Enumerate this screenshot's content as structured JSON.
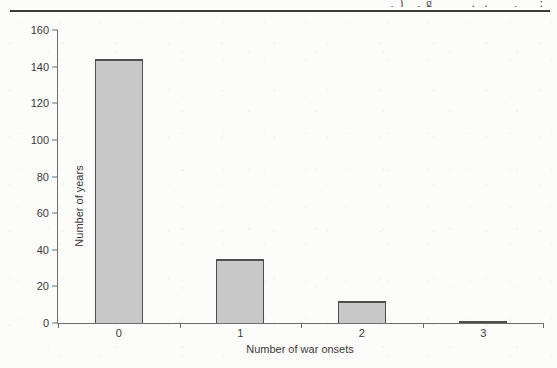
{
  "page": {
    "cropped_header_fragment": ", )   , g         .  .      ,     ;"
  },
  "chart_data": {
    "type": "bar",
    "title": "",
    "xlabel": "Number of war onsets",
    "ylabel": "Number of years",
    "categories": [
      "0",
      "1",
      "2",
      "3"
    ],
    "values": [
      144,
      35,
      12,
      1
    ],
    "ylim": [
      0,
      160
    ],
    "yticks": [
      0,
      20,
      40,
      60,
      80,
      100,
      120,
      140,
      160
    ],
    "grid": false,
    "legend_position": "none",
    "bar_fill_color": "#c8c8c8",
    "bar_border_color": "#4f4f4f",
    "axis_color": "#6e6e6e",
    "text_color": "#3a3a3a",
    "bar_width_px": 48
  }
}
